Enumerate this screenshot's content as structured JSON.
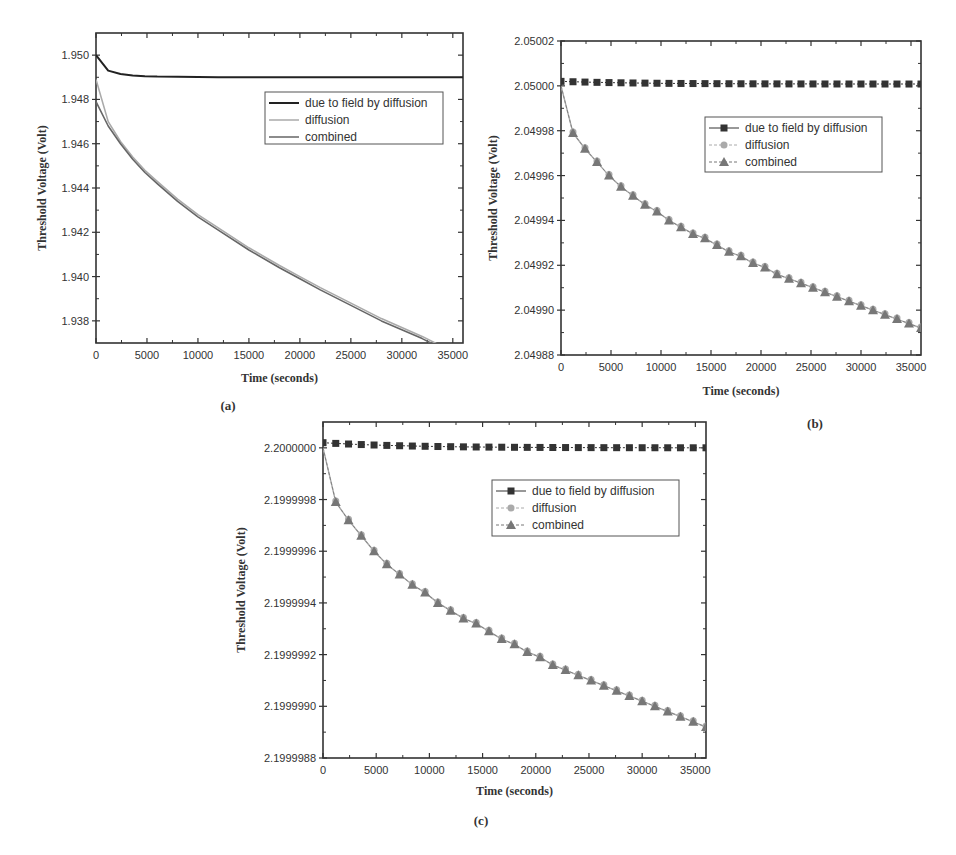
{
  "chart_data": [
    {
      "id": "a",
      "type": "line",
      "caption": "(a)",
      "title": "",
      "xlabel": "Time (seconds)",
      "ylabel": "Threshold Voltage (Volt)",
      "xlim": [
        0,
        36000
      ],
      "ylim": [
        1.937,
        1.951
      ],
      "xticks": [
        0,
        5000,
        10000,
        15000,
        20000,
        25000,
        30000,
        35000
      ],
      "yticks": [
        "1.938",
        "1.940",
        "1.942",
        "1.944",
        "1.946",
        "1.948",
        "1.950"
      ],
      "grid": false,
      "legend_position": "upper right",
      "x": [
        0,
        1200,
        2400,
        3600,
        4800,
        6000,
        8000,
        10000,
        12000,
        15000,
        18000,
        20000,
        22000,
        25000,
        28000,
        30000,
        32000,
        35000,
        36000
      ],
      "series": [
        {
          "name": "due to field by diffusion",
          "color": "#222222",
          "marker": "none",
          "values": [
            1.95,
            1.9493,
            1.94915,
            1.94908,
            1.94905,
            1.94903,
            1.94902,
            1.94901,
            1.949,
            1.949,
            1.949,
            1.949,
            1.949,
            1.949,
            1.949,
            1.949,
            1.949,
            1.949,
            1.949
          ]
        },
        {
          "name": "diffusion",
          "color": "#aaaaaa",
          "marker": "none",
          "values": [
            1.9489,
            1.947,
            1.9461,
            1.9454,
            1.9448,
            1.9443,
            1.9435,
            1.9428,
            1.9422,
            1.9413,
            1.9405,
            1.94,
            1.9395,
            1.9388,
            1.9381,
            1.9377,
            1.9373,
            1.9366,
            1.9364
          ]
        },
        {
          "name": "combined",
          "color": "#666666",
          "marker": "none",
          "values": [
            1.9479,
            1.9468,
            1.946,
            1.9453,
            1.9447,
            1.9442,
            1.9434,
            1.9427,
            1.9421,
            1.9412,
            1.9404,
            1.9399,
            1.9394,
            1.9387,
            1.938,
            1.9376,
            1.9372,
            1.9365,
            1.9363
          ]
        }
      ]
    },
    {
      "id": "b",
      "type": "line",
      "caption": "(b)",
      "title": "",
      "xlabel": "Time (seconds)",
      "ylabel": "Threshold Voltage (Volt)",
      "xlim": [
        0,
        36000
      ],
      "ylim": [
        2.04988,
        2.05002
      ],
      "xticks": [
        0,
        5000,
        10000,
        15000,
        20000,
        25000,
        30000,
        35000
      ],
      "yticks": [
        "2.04988",
        "2.04990",
        "2.04992",
        "2.04994",
        "2.04996",
        "2.04998",
        "2.05000",
        "2.05002"
      ],
      "grid": false,
      "legend_position": "upper right",
      "marker_interval": 1200,
      "series": [
        {
          "name": "due to field by diffusion",
          "color": "#333333",
          "marker": "square",
          "start": 2.050002,
          "end": 2.0500008
        },
        {
          "name": "diffusion",
          "color": "#aaaaaa",
          "marker": "circle",
          "start": 2.05,
          "end": 2.049892
        },
        {
          "name": "combined",
          "color": "#777777",
          "marker": "triangle",
          "start": 2.05,
          "end": 2.049892
        }
      ],
      "sample_points": {
        "x": [
          0,
          1200,
          2400,
          3600,
          4800,
          6000,
          7200,
          8400,
          9600,
          10800,
          12000,
          13200,
          14400,
          15600,
          16800,
          18000,
          19200,
          20400,
          21600,
          22800,
          24000,
          25200,
          26400,
          27600,
          28800,
          30000,
          31200,
          32400,
          33600,
          34800,
          36000
        ],
        "combined": [
          2.05,
          2.049979,
          2.049972,
          2.049966,
          2.04996,
          2.049955,
          2.049951,
          2.049947,
          2.049944,
          2.04994,
          2.049937,
          2.049934,
          2.049932,
          2.049929,
          2.049926,
          2.049924,
          2.049921,
          2.049919,
          2.049916,
          2.049914,
          2.049912,
          2.04991,
          2.049908,
          2.049906,
          2.049904,
          2.049902,
          2.0499,
          2.049898,
          2.049896,
          2.049894,
          2.049892
        ]
      }
    },
    {
      "id": "c",
      "type": "line",
      "caption": "(c)",
      "title": "",
      "xlabel": "Time (seconds)",
      "ylabel": "Threshold Voltage (Volt)",
      "xlim": [
        0,
        36000
      ],
      "ylim": [
        2.1999988,
        2.2000001
      ],
      "xticks": [
        0,
        5000,
        10000,
        15000,
        20000,
        25000,
        30000,
        35000
      ],
      "yticks": [
        "2.1999988",
        "2.1999990",
        "2.1999992",
        "2.1999994",
        "2.1999996",
        "2.1999998",
        "2.2000000"
      ],
      "grid": false,
      "legend_position": "upper right",
      "marker_interval": 1200,
      "series": [
        {
          "name": "due to field by diffusion",
          "color": "#333333",
          "marker": "square",
          "start": 2.20000002,
          "end": 2.2
        },
        {
          "name": "diffusion",
          "color": "#aaaaaa",
          "marker": "circle",
          "start": 2.2,
          "end": 2.19999892
        },
        {
          "name": "combined",
          "color": "#777777",
          "marker": "triangle",
          "start": 2.2,
          "end": 2.19999892
        }
      ],
      "sample_points": {
        "x": [
          0,
          1200,
          2400,
          3600,
          4800,
          6000,
          7200,
          8400,
          9600,
          10800,
          12000,
          13200,
          14400,
          15600,
          16800,
          18000,
          19200,
          20400,
          21600,
          22800,
          24000,
          25200,
          26400,
          27600,
          28800,
          30000,
          31200,
          32400,
          33600,
          34800,
          36000
        ],
        "combined": [
          2.2,
          2.19999979,
          2.19999972,
          2.19999966,
          2.1999996,
          2.19999955,
          2.19999951,
          2.19999947,
          2.19999944,
          2.1999994,
          2.19999937,
          2.19999934,
          2.19999932,
          2.19999929,
          2.19999926,
          2.19999924,
          2.19999921,
          2.19999919,
          2.19999916,
          2.19999914,
          2.19999912,
          2.1999991,
          2.19999908,
          2.19999906,
          2.19999904,
          2.19999902,
          2.199999,
          2.19999898,
          2.19999896,
          2.19999894,
          2.19999892
        ]
      }
    }
  ],
  "figure": {
    "captions": [
      "(a)",
      "(b)",
      "(c)"
    ],
    "legend_labels": [
      "due to field by diffusion",
      "diffusion",
      "combined"
    ],
    "xlabel": "Time (seconds)",
    "ylabel": "Threshold Voltage (Volt)"
  }
}
